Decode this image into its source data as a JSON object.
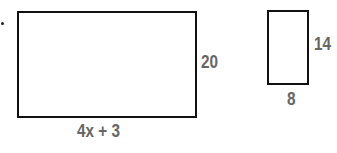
{
  "figure": {
    "large_rectangle": {
      "width_label": "4x + 3",
      "height_label": "20"
    },
    "small_rectangle": {
      "width_label": "8",
      "height_label": "14"
    }
  }
}
